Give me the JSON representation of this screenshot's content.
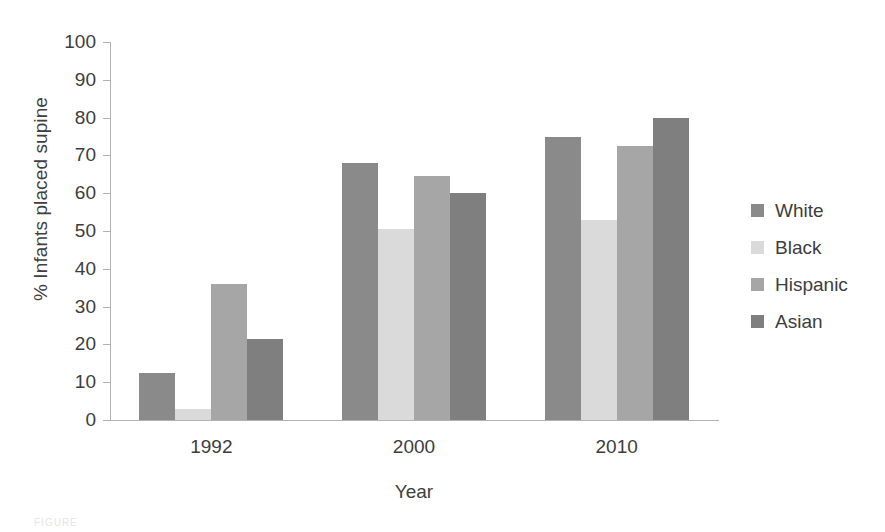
{
  "chart_data": {
    "type": "bar",
    "title": "",
    "subtitle": "",
    "xlabel": "Year",
    "ylabel": "% Infants placed supine",
    "categories": [
      "1992",
      "2000",
      "2010"
    ],
    "series": [
      {
        "name": "White",
        "color": "#8a8a8a",
        "values": [
          12.5,
          68.0,
          75.0
        ]
      },
      {
        "name": "Black",
        "color": "#dadada",
        "values": [
          3.0,
          50.5,
          53.0
        ]
      },
      {
        "name": "Hispanic",
        "color": "#a6a6a6",
        "values": [
          36.0,
          64.5,
          72.5
        ]
      },
      {
        "name": "Asian",
        "color": "#7f7f7f",
        "values": [
          21.5,
          60.0,
          80.0
        ]
      }
    ],
    "ylim": [
      0,
      100
    ],
    "ytick_step": 10,
    "yticks": [
      "100",
      "90",
      "80",
      "70",
      "60",
      "50",
      "40",
      "30",
      "20",
      "10",
      "0"
    ],
    "grid": false,
    "legend_position": "right",
    "axis_color": "#b2b2b2",
    "text_color": "#3d3d3d",
    "background": "#ffffff"
  },
  "caption": {
    "remnant_text": "FIGURE"
  }
}
